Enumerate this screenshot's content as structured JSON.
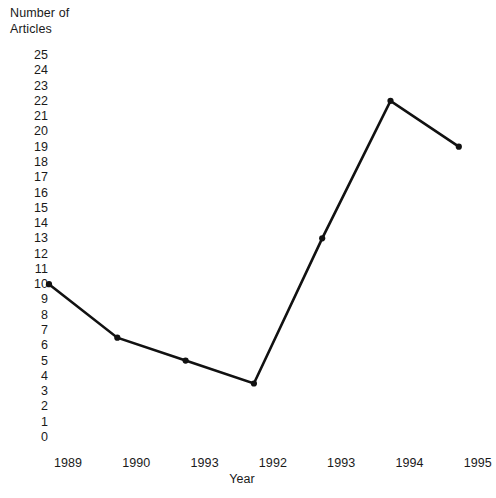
{
  "chart_data": {
    "type": "line",
    "title": "",
    "xlabel": "Year",
    "ylabel": "Number of\nArticles",
    "categories": [
      "1989",
      "1990",
      "1993",
      "1992",
      "1993",
      "1994",
      "1995"
    ],
    "values": [
      10,
      6.5,
      5,
      3.5,
      13,
      22,
      19
    ],
    "series": [
      {
        "name": "Number of Articles",
        "values": [
          10,
          6.5,
          5,
          3.5,
          13,
          22,
          19
        ]
      }
    ],
    "ylim": [
      0,
      25
    ],
    "y_ticks": [
      25,
      24,
      23,
      22,
      21,
      20,
      19,
      18,
      17,
      16,
      15,
      14,
      13,
      12,
      11,
      10,
      9,
      8,
      7,
      6,
      5,
      4,
      3,
      2,
      1,
      0
    ],
    "grid": false,
    "legend": "none",
    "line_color": "#111111",
    "marker_color": "#111111",
    "background_color": "#ffffff",
    "text_color": "#1a1a1a"
  }
}
